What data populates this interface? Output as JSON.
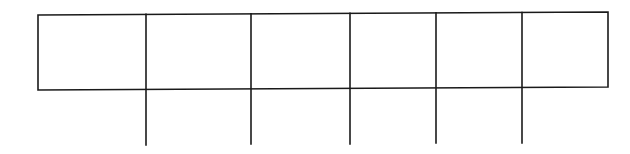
{
  "diagram": {
    "type": "segmented-box-with-stems",
    "stroke_color": "#1a1a1a",
    "background": "#ffffff",
    "box": {
      "left": 38,
      "right": 608,
      "top_left_y": 15,
      "top_right_y": 12,
      "bottom_left_y": 90,
      "bottom_right_y": 87
    },
    "dividers_x": [
      146,
      251,
      350,
      436,
      522
    ],
    "stem_bottom_y": [
      145,
      144,
      144,
      143,
      143
    ],
    "cell_count": 6,
    "cells": [
      "",
      "",
      "",
      "",
      "",
      ""
    ]
  }
}
